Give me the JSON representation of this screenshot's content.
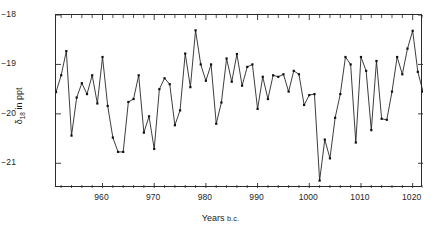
{
  "chart_data": {
    "type": "line",
    "title": "",
    "xlabel": "Years B.C.",
    "xlabel_main": "Years",
    "xlabel_small": "b.c.",
    "ylabel": "δ18 in ppt",
    "ylabel_symbol": "δ",
    "ylabel_sub": "18",
    "ylabel_rest": " in ppt",
    "xlim": [
      951,
      1022
    ],
    "ylim": [
      -21.5,
      -18.0
    ],
    "yticks": [
      -18,
      -19,
      -20,
      -21
    ],
    "ytick_labels": [
      "−18",
      "−19",
      "−20",
      "−21"
    ],
    "xticks": [
      960,
      970,
      980,
      990,
      1000,
      1010,
      1020
    ],
    "xtick_labels": [
      "960",
      "970",
      "980",
      "990",
      "1000",
      "1010",
      "1020"
    ],
    "xminor_step": 2,
    "grid": false,
    "legend": null,
    "marker": "square",
    "marker_size": 2.2,
    "line_color": "#1a1a1a",
    "marker_color": "#111111",
    "axis_color": "#2b2b2b",
    "x": [
      951,
      952,
      953,
      954,
      955,
      956,
      957,
      958,
      959,
      960,
      961,
      962,
      963,
      964,
      965,
      966,
      967,
      968,
      969,
      970,
      971,
      972,
      973,
      974,
      975,
      976,
      977,
      978,
      979,
      980,
      981,
      982,
      983,
      984,
      985,
      986,
      987,
      988,
      989,
      990,
      991,
      992,
      993,
      994,
      995,
      996,
      997,
      998,
      999,
      1000,
      1001,
      1002,
      1003,
      1004,
      1005,
      1006,
      1007,
      1008,
      1009,
      1010,
      1011,
      1012,
      1013,
      1014,
      1015,
      1016,
      1017,
      1018,
      1019,
      1020,
      1021,
      1022
    ],
    "values": [
      -19.56,
      -19.22,
      -18.73,
      -20.44,
      -19.67,
      -19.38,
      -19.6,
      -19.22,
      -19.79,
      -18.85,
      -19.84,
      -20.48,
      -20.77,
      -20.77,
      -19.76,
      -19.7,
      -19.22,
      -20.38,
      -20.05,
      -20.71,
      -19.5,
      -19.28,
      -19.4,
      -20.23,
      -19.93,
      -18.78,
      -19.46,
      -18.31,
      -19.0,
      -19.33,
      -19.0,
      -20.2,
      -19.77,
      -18.88,
      -19.35,
      -18.79,
      -19.43,
      -19.05,
      -19.0,
      -19.9,
      -19.25,
      -19.7,
      -19.22,
      -19.25,
      -19.2,
      -19.55,
      -19.13,
      -19.2,
      -19.82,
      -19.62,
      -19.6,
      -21.35,
      -20.52,
      -20.9,
      -20.08,
      -19.6,
      -18.85,
      -19.0,
      -20.58,
      -18.85,
      -19.13,
      -20.33,
      -18.93,
      -20.1,
      -20.12,
      -19.55,
      -18.85,
      -19.2,
      -18.68,
      -18.32,
      -19.15,
      -19.55
    ]
  }
}
